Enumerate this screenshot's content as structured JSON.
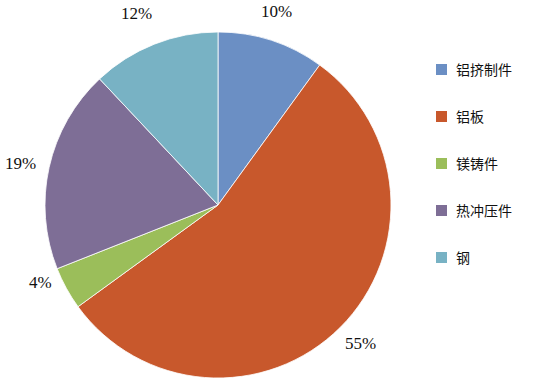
{
  "chart_data": {
    "type": "pie",
    "title": "",
    "categories": [
      "铝挤制件",
      "铝板",
      "镁铸件",
      "热冲压件",
      "钢"
    ],
    "values": [
      10,
      55,
      4,
      19,
      12
    ],
    "value_labels": [
      "10%",
      "55%",
      "4%",
      "19%",
      "12%"
    ],
    "unit": "%",
    "colors": [
      "#6B8FC4",
      "#C8582C",
      "#9BBE5A",
      "#7E6E96",
      "#78B2C4"
    ],
    "start_angle_deg": 0,
    "direction": "clockwise",
    "legend_position": "right",
    "grid": false,
    "xlabel": "",
    "ylabel": ""
  },
  "labels": {
    "slice_0": "10%",
    "slice_1": "55%",
    "slice_2": "4%",
    "slice_3": "19%",
    "slice_4": "12%"
  },
  "legend": {
    "items": [
      {
        "label": "铝挤制件",
        "color": "#6B8FC4"
      },
      {
        "label": "铝板",
        "color": "#C8582C"
      },
      {
        "label": "镁铸件",
        "color": "#9BBE5A"
      },
      {
        "label": "热冲压件",
        "color": "#7E6E96"
      },
      {
        "label": "钢",
        "color": "#78B2C4"
      }
    ]
  }
}
